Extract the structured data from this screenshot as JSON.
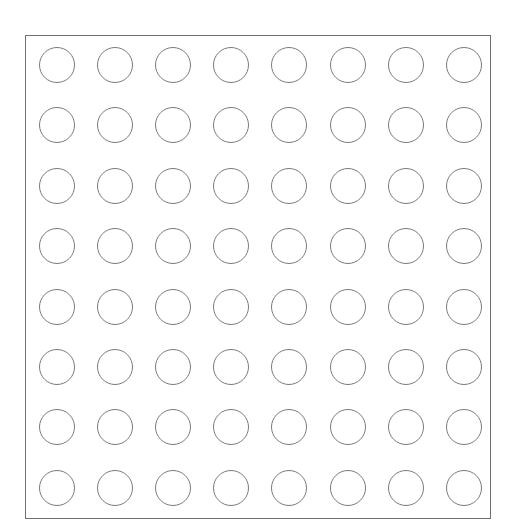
{
  "board": {
    "rows": 8,
    "cols": 8,
    "cell_shape": "circle",
    "cell_state": "empty",
    "colors": {
      "border": "#6f6f6f",
      "circle_stroke": "#7a7a7a",
      "fill": "#ffffff"
    },
    "cells": [
      [
        "empty",
        "empty",
        "empty",
        "empty",
        "empty",
        "empty",
        "empty",
        "empty"
      ],
      [
        "empty",
        "empty",
        "empty",
        "empty",
        "empty",
        "empty",
        "empty",
        "empty"
      ],
      [
        "empty",
        "empty",
        "empty",
        "empty",
        "empty",
        "empty",
        "empty",
        "empty"
      ],
      [
        "empty",
        "empty",
        "empty",
        "empty",
        "empty",
        "empty",
        "empty",
        "empty"
      ],
      [
        "empty",
        "empty",
        "empty",
        "empty",
        "empty",
        "empty",
        "empty",
        "empty"
      ],
      [
        "empty",
        "empty",
        "empty",
        "empty",
        "empty",
        "empty",
        "empty",
        "empty"
      ],
      [
        "empty",
        "empty",
        "empty",
        "empty",
        "empty",
        "empty",
        "empty",
        "empty"
      ],
      [
        "empty",
        "empty",
        "empty",
        "empty",
        "empty",
        "empty",
        "empty",
        "empty"
      ]
    ]
  }
}
